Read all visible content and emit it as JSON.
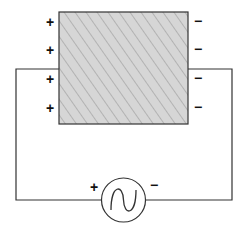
{
  "diagram": {
    "type": "circuit",
    "block": {
      "fill_color": "#d4d4d4",
      "hatch_color": "#a8a8a8",
      "stroke_color": "#333333"
    },
    "left_charges": [
      "+",
      "+",
      "+",
      "+"
    ],
    "right_charges": [
      "−",
      "−",
      "−",
      "−"
    ],
    "source": {
      "type": "ac-source",
      "symbol": "∿",
      "positive_terminal": "+",
      "negative_terminal": "−"
    },
    "wire_color": "#333333"
  }
}
